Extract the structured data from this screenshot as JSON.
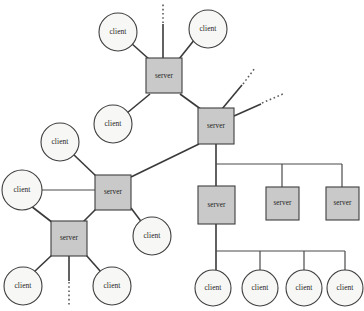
{
  "diagram": {
    "type": "network-topology-diagram",
    "background_color": "#ffffff",
    "server_fill": "#c9c9c9",
    "client_fill": "#f7f7f5",
    "stroke_color": "#3f3f3f",
    "labels": {
      "server": "server",
      "client": "client"
    },
    "nodes": [
      {
        "id": "s-top",
        "kind": "server",
        "label": "server",
        "x": 164,
        "y": 76,
        "w": 36,
        "h": 35
      },
      {
        "id": "s-hub",
        "kind": "server",
        "label": "server",
        "x": 216,
        "y": 126,
        "w": 36,
        "h": 36
      },
      {
        "id": "s-midleft",
        "kind": "server",
        "label": "server",
        "x": 113,
        "y": 192,
        "w": 36,
        "h": 35
      },
      {
        "id": "s-lowleft",
        "kind": "server",
        "label": "server",
        "x": 69,
        "y": 238,
        "w": 36,
        "h": 35
      },
      {
        "id": "s-branch1",
        "kind": "server",
        "label": "server",
        "x": 216,
        "y": 205,
        "w": 37,
        "h": 38
      },
      {
        "id": "s-branch2",
        "kind": "server",
        "label": "server",
        "x": 282,
        "y": 203,
        "w": 33,
        "h": 33
      },
      {
        "id": "s-branch3",
        "kind": "server",
        "label": "server",
        "x": 342,
        "y": 203,
        "w": 33,
        "h": 33
      },
      {
        "id": "c-top-left",
        "kind": "client",
        "label": "client",
        "x": 118,
        "y": 32,
        "r": 19
      },
      {
        "id": "c-top-right",
        "kind": "client",
        "label": "client",
        "x": 208,
        "y": 29,
        "r": 19
      },
      {
        "id": "c-top-below",
        "kind": "client",
        "label": "client",
        "x": 113,
        "y": 124,
        "r": 19
      },
      {
        "id": "c-left-upper",
        "kind": "client",
        "label": "client",
        "x": 60,
        "y": 142,
        "r": 19
      },
      {
        "id": "c-left-mid",
        "kind": "client",
        "label": "client",
        "x": 22,
        "y": 190,
        "r": 20
      },
      {
        "id": "c-right-mid",
        "kind": "client",
        "label": "client",
        "x": 152,
        "y": 236,
        "r": 19
      },
      {
        "id": "c-bot-left",
        "kind": "client",
        "label": "client",
        "x": 23,
        "y": 286,
        "r": 19
      },
      {
        "id": "c-bot-right",
        "kind": "client",
        "label": "client",
        "x": 112,
        "y": 286,
        "r": 19
      },
      {
        "id": "c-b1",
        "kind": "client",
        "label": "client",
        "x": 213,
        "y": 288,
        "r": 18
      },
      {
        "id": "c-b2",
        "kind": "client",
        "label": "client",
        "x": 260,
        "y": 288,
        "r": 18
      },
      {
        "id": "c-b3",
        "kind": "client",
        "label": "client",
        "x": 304,
        "y": 288,
        "r": 18
      },
      {
        "id": "c-b4",
        "kind": "client",
        "label": "client",
        "x": 345,
        "y": 288,
        "r": 18
      }
    ],
    "links": [
      {
        "from": "c-top-left",
        "to": "s-top",
        "style": "solid"
      },
      {
        "from": "c-top-right",
        "to": "s-top",
        "style": "solid"
      },
      {
        "from": "c-top-below",
        "to": "s-top",
        "style": "solid"
      },
      {
        "from": "s-top",
        "to": "s-hub",
        "style": "solid"
      },
      {
        "from": "s-hub",
        "to": "s-midleft",
        "style": "solid"
      },
      {
        "from": "c-left-upper",
        "to": "s-midleft",
        "style": "solid"
      },
      {
        "from": "c-left-mid",
        "to": "s-midleft",
        "style": "solid"
      },
      {
        "from": "c-right-mid",
        "to": "s-midleft",
        "style": "solid"
      },
      {
        "from": "s-midleft",
        "to": "s-lowleft",
        "style": "solid"
      },
      {
        "from": "c-left-mid",
        "to": "s-lowleft",
        "style": "solid"
      },
      {
        "from": "c-bot-left",
        "to": "s-lowleft",
        "style": "solid"
      },
      {
        "from": "c-bot-right",
        "to": "s-lowleft",
        "style": "solid"
      },
      {
        "from": "s-hub",
        "to": "s-branch1",
        "style": "orthogonal"
      },
      {
        "from": "s-hub",
        "to": "s-branch2",
        "style": "orthogonal"
      },
      {
        "from": "s-hub",
        "to": "s-branch3",
        "style": "orthogonal"
      },
      {
        "from": "s-branch1",
        "to": "c-b1",
        "style": "orthogonal"
      },
      {
        "from": "s-branch1",
        "to": "c-b2",
        "style": "orthogonal"
      },
      {
        "from": "s-branch1",
        "to": "c-b3",
        "style": "orthogonal"
      },
      {
        "from": "s-branch1",
        "to": "c-b4",
        "style": "orthogonal"
      }
    ],
    "stub_links": [
      {
        "id": "stub-top",
        "from": "s-top",
        "direction": "up",
        "style": "solid-then-dashed"
      },
      {
        "id": "stub-hub-upper",
        "from": "s-hub",
        "direction": "upper-right",
        "style": "solid-then-dashed"
      },
      {
        "id": "stub-hub-lower",
        "from": "s-hub",
        "direction": "right-up",
        "style": "solid-then-dashed"
      },
      {
        "id": "stub-lowleft",
        "from": "s-lowleft",
        "direction": "down",
        "style": "solid-then-dashed"
      }
    ],
    "counts": {
      "servers": 7,
      "clients": 12,
      "stubs": 4
    }
  }
}
